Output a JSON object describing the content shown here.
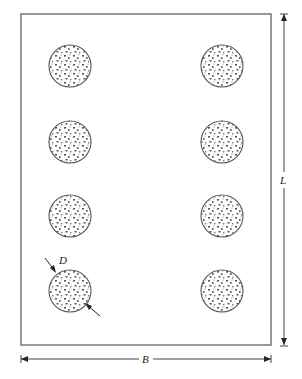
{
  "diagram": {
    "colors": {
      "line": "#555555",
      "stipple": "#555555",
      "background": "#ffffff"
    },
    "rectangle": {
      "x": 21,
      "y": 14,
      "width": 250,
      "height": 331
    },
    "circles": {
      "radius": 21,
      "columns_x": [
        70,
        222
      ],
      "rows_y": [
        66,
        142,
        216,
        291
      ],
      "count": 8
    },
    "labels": {
      "length": "L",
      "width": "B",
      "diameter": "D"
    },
    "dimensions": {
      "length_line": {
        "x": 284,
        "y1": 14,
        "y2": 345,
        "label": "L"
      },
      "width_line": {
        "y": 359,
        "x1": 21,
        "x2": 271,
        "label": "B"
      },
      "diameter_arrows": {
        "label": "D",
        "circle": "bottom-left"
      }
    }
  }
}
